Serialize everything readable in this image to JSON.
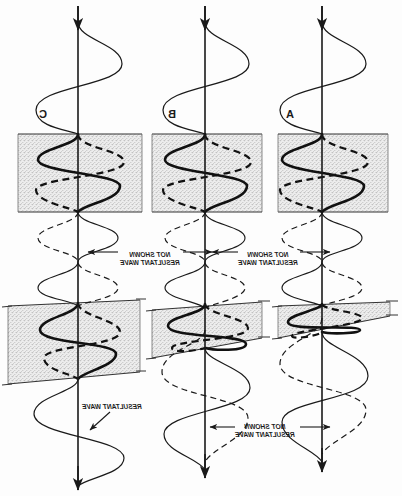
{
  "figure": {
    "orientation": "mirrored",
    "background_color": "#fdfdfd",
    "ink_color": "#1a1a1a",
    "band_fill_color": "#ebebeb",
    "band_stipple_color": "#777777",
    "band_edge_color": "#333333"
  },
  "columns": [
    {
      "id": "C",
      "label": "C",
      "center_x": 78,
      "label_x": 47,
      "label_y": 118
    },
    {
      "id": "B",
      "label": "B",
      "center_x": 205,
      "label_x": 176,
      "label_y": 118
    },
    {
      "id": "A",
      "label": "A",
      "center_x": 322,
      "label_x": 294,
      "label_y": 118
    }
  ],
  "annotations": [
    {
      "id": "ann-upper-c",
      "line1": "RESULTANT WAVE",
      "line2": "NOT SHOWN",
      "x": 150,
      "y": 257
    },
    {
      "id": "ann-upper-b",
      "line1": "RESULTANT WAVE",
      "line2": "NOT SHOWN",
      "x": 268,
      "y": 257
    },
    {
      "id": "ann-lower-c",
      "line1": "RESULTANT WAVE",
      "line2": "",
      "x": 112,
      "y": 409
    },
    {
      "id": "ann-lower-b",
      "line1": "RESULTANT WAVE",
      "line2": "NOT SHOWN",
      "x": 265,
      "y": 434
    }
  ],
  "axes": {
    "arrow_top_label": "propagation-direction-down",
    "arrow_bottom_label": "propagation-direction-down",
    "top_y": 6,
    "bottom_y": 490
  },
  "bands": {
    "upper": {
      "top_y": 134,
      "bottom_y": 212,
      "shape": "rectangle"
    },
    "lower": {
      "top_y": 300,
      "bottom_y": 382,
      "shape": "wedge"
    }
  },
  "waves": {
    "incident_label": "incident-wave",
    "reflected_label": "reflected-wave-dashed",
    "transmitted_label": "transmitted-wave",
    "resultant_label": "resultant-wave"
  }
}
